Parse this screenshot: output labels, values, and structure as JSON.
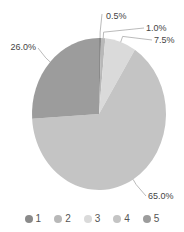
{
  "chart_data": {
    "type": "pie",
    "title": "",
    "categories": [
      "1",
      "2",
      "3",
      "4",
      "5"
    ],
    "values": [
      0.5,
      1.0,
      7.5,
      65.0,
      26.0
    ],
    "labels": [
      "0.5%",
      "1.0%",
      "7.5%",
      "65.0%",
      "26.0%"
    ],
    "colors": [
      "#8a8a8a",
      "#b8b8b8",
      "#dadada",
      "#c4c4c4",
      "#9c9c9c"
    ],
    "start_angle": "12 o'clock, clockwise",
    "legend_position": "bottom"
  },
  "legend": [
    {
      "label": "1",
      "color": "#8a8a8a"
    },
    {
      "label": "2",
      "color": "#b8b8b8"
    },
    {
      "label": "3",
      "color": "#dadada"
    },
    {
      "label": "4",
      "color": "#c4c4c4"
    },
    {
      "label": "5",
      "color": "#9c9c9c"
    }
  ]
}
